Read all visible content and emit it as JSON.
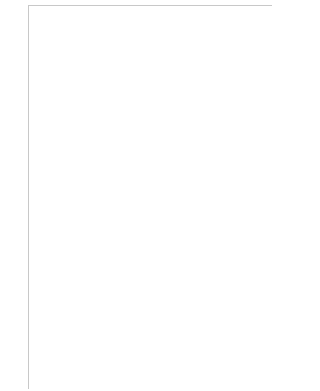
{
  "chart": {
    "columns": 16,
    "rows_count": 27,
    "legend_symbols": {
      "X": "x-stitch",
      "O": "o-stitch",
      "D": "triangle-stitch",
      "T": "filled-half-square",
      "_": "blank"
    },
    "colors": {
      "grid": "#c8c8c8",
      "symbol": "#8c8c8c",
      "fill": "#8e8e8e",
      "label": "#555555"
    },
    "rows": [
      {
        "n": 27,
        "cells": "XXX_XXX____X____"
      },
      {
        "n": 26,
        "cells": "X_X_X_X___XXX___"
      },
      {
        "n": 25,
        "cells": "XTXTXTXXTXXTXXTX"
      },
      {
        "n": 24,
        "cells": "TTDDDTTDDDTTTDDD"
      },
      {
        "n": 23,
        "cells": "OTTOTTOOOOTOTOOO"
      },
      {
        "n": 22,
        "cells": "OTTTTOOTTTOOOTTT"
      },
      {
        "n": 21,
        "cells": "TOOTOOTTTOOTOOTT"
      },
      {
        "n": 20,
        "cells": "OTTTTOOTTTOOOTTT"
      },
      {
        "n": 19,
        "cells": "OTTOTTOOOOTOTOOO"
      },
      {
        "n": 18,
        "cells": "TTDDDTTDDDTTTDDD"
      },
      {
        "n": 17,
        "cells": "TTDTDTTTDDTTTDDT"
      },
      {
        "n": 16,
        "cells": "XTXTXTXXTXXTXXTX"
      },
      {
        "n": 15,
        "cells": "X_X_X_X___XXX___"
      },
      {
        "n": 14,
        "cells": "XXX_XXX____X____"
      },
      {
        "n": 13,
        "cells": "________________"
      },
      {
        "n": 12,
        "cells": "________________"
      },
      {
        "n": 11,
        "cells": "___T___TT__T__TT"
      },
      {
        "n": 10,
        "cells": "TDDDDDTTTDDDDDTT"
      },
      {
        "n": 9,
        "cells": "TTDTDTTTDDTDTDDT"
      },
      {
        "n": 8,
        "cells": "TTDTDTTDDTTDTTDD"
      },
      {
        "n": 7,
        "cells": "OOXXXOOOXXXOXXXO"
      },
      {
        "n": 6,
        "cells": "XXXOXXXOOOOXOOOO"
      },
      {
        "n": 5,
        "cells": "OOXXXOOOXXXOXXXO"
      },
      {
        "n": 4,
        "cells": "TTDTDTTDDTTDTTDD"
      },
      {
        "n": 3,
        "cells": "TTDTDTTTDDTDTDDT"
      },
      {
        "n": 2,
        "cells": "TDDDDDTTTDDDDDTT"
      },
      {
        "n": 1,
        "cells": "___T___TT__T__TT"
      }
    ],
    "left_labels": [
      "26",
      "24",
      "22",
      "20",
      "18",
      "16",
      "14",
      "12",
      "10",
      "8",
      "6",
      "4",
      "2"
    ],
    "right_labels": [
      "27",
      "25",
      "23",
      "21",
      "19",
      "17",
      "15",
      "13",
      "11",
      "9",
      "7",
      "5",
      "3",
      "1"
    ]
  }
}
